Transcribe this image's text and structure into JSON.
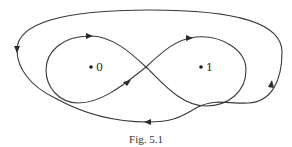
{
  "figure": {
    "caption": "Fig. 5.1",
    "stroke_color": "#3a3a3a",
    "points": [
      {
        "label": "0",
        "x": 91,
        "y": 67
      },
      {
        "label": "1",
        "x": 201,
        "y": 67
      }
    ],
    "curves": [
      {
        "name": "figure-eight-loop",
        "description": "Figure-eight curve crossing between points 0 and 1, oriented with arrows"
      },
      {
        "name": "outer-loop",
        "description": "Large closed curve encircling both points, oriented counterclockwise on left, passing below"
      }
    ]
  }
}
